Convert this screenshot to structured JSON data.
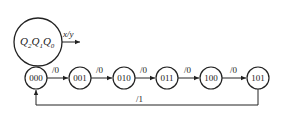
{
  "legend": {
    "state_vars": [
      "Q",
      "2",
      "Q",
      "1",
      "Q",
      "0"
    ],
    "io_label": "x/y"
  },
  "states": [
    {
      "code": "000",
      "cx": 36,
      "cy": 78
    },
    {
      "code": "001",
      "cx": 80,
      "cy": 78
    },
    {
      "code": "010",
      "cx": 124,
      "cy": 78
    },
    {
      "code": "011",
      "cx": 167,
      "cy": 78
    },
    {
      "code": "100",
      "cx": 211,
      "cy": 78
    },
    {
      "code": "101",
      "cx": 258,
      "cy": 78
    }
  ],
  "transitions": [
    {
      "from": "000",
      "to": "001",
      "label": "/0"
    },
    {
      "from": "001",
      "to": "010",
      "label": "/0"
    },
    {
      "from": "010",
      "to": "011",
      "label": "/0"
    },
    {
      "from": "011",
      "to": "100",
      "label": "/0"
    },
    {
      "from": "100",
      "to": "101",
      "label": "/0"
    },
    {
      "from": "101",
      "to": "000",
      "label": "/1"
    }
  ]
}
